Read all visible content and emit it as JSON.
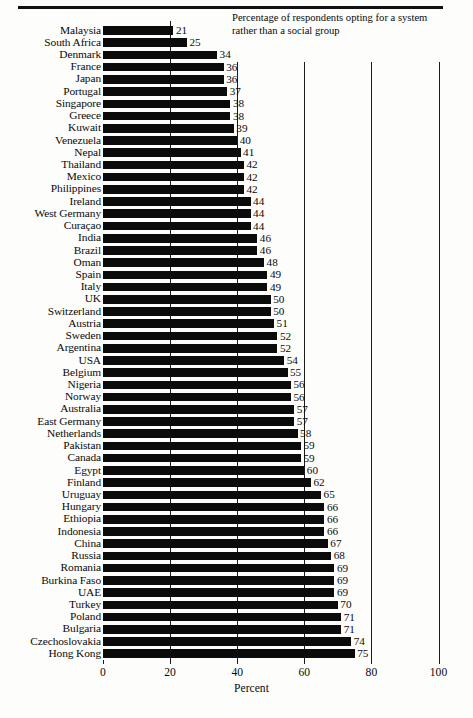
{
  "annotation": "Percentage of respondents opting for a system rather than a social group",
  "chart_data": {
    "type": "bar",
    "orientation": "horizontal",
    "title": "",
    "subtitle": "",
    "annotations": [
      "Percentage of respondents opting for a system rather than a social group"
    ],
    "xlabel": "Percent",
    "ylabel": "",
    "xlim": [
      0,
      100
    ],
    "xticks": [
      0,
      20,
      40,
      60,
      80,
      100
    ],
    "xtick_labels": [
      "0",
      "20",
      "40",
      "60",
      "80",
      "100"
    ],
    "grid": true,
    "grid_axis": "x",
    "legend": false,
    "bar_color": "#0b0b0b",
    "background_color": "#fdfdfb",
    "categories": [
      "Malaysia",
      "South Africa",
      "Denmark",
      "France",
      "Japan",
      "Portugal",
      "Singapore",
      "Greece",
      "Kuwait",
      "Venezuela",
      "Nepal",
      "Thailand",
      "Mexico",
      "Philippines",
      "Ireland",
      "West Germany",
      "Curaçao",
      "India",
      "Brazil",
      "Oman",
      "Spain",
      "Italy",
      "UK",
      "Switzerland",
      "Austria",
      "Sweden",
      "Argentina",
      "USA",
      "Belgium",
      "Nigeria",
      "Norway",
      "Australia",
      "East Germany",
      "Netherlands",
      "Pakistan",
      "Canada",
      "Egypt",
      "Finland",
      "Uruguay",
      "Hungary",
      "Ethiopia",
      "Indonesia",
      "China",
      "Russia",
      "Romania",
      "Burkina Faso",
      "UAE",
      "Turkey",
      "Poland",
      "Bulgaria",
      "Czechoslovakia",
      "Hong Kong"
    ],
    "values": [
      21,
      25,
      34,
      36,
      36,
      37,
      38,
      38,
      39,
      40,
      41,
      42,
      42,
      42,
      44,
      44,
      44,
      46,
      46,
      48,
      49,
      49,
      50,
      50,
      51,
      52,
      52,
      54,
      55,
      56,
      56,
      57,
      57,
      58,
      59,
      59,
      60,
      62,
      65,
      66,
      66,
      66,
      67,
      68,
      69,
      69,
      69,
      70,
      71,
      71,
      74,
      75
    ],
    "value_labels": [
      "21",
      "25",
      "34",
      "36",
      "36",
      "37",
      "38",
      "38",
      "39",
      "40",
      "41",
      "42",
      "42",
      "42",
      "44",
      "44",
      "44",
      "46",
      "46",
      "48",
      "49",
      "49",
      "50",
      "50",
      "51",
      "52",
      "52",
      "54",
      "55",
      "56",
      "56",
      "57",
      "57",
      "58",
      "59",
      "59",
      "60",
      "62",
      "65",
      "66",
      "66",
      "66",
      "67",
      "68",
      "69",
      "69",
      "69",
      "70",
      "71",
      "71",
      "74",
      "75"
    ]
  }
}
